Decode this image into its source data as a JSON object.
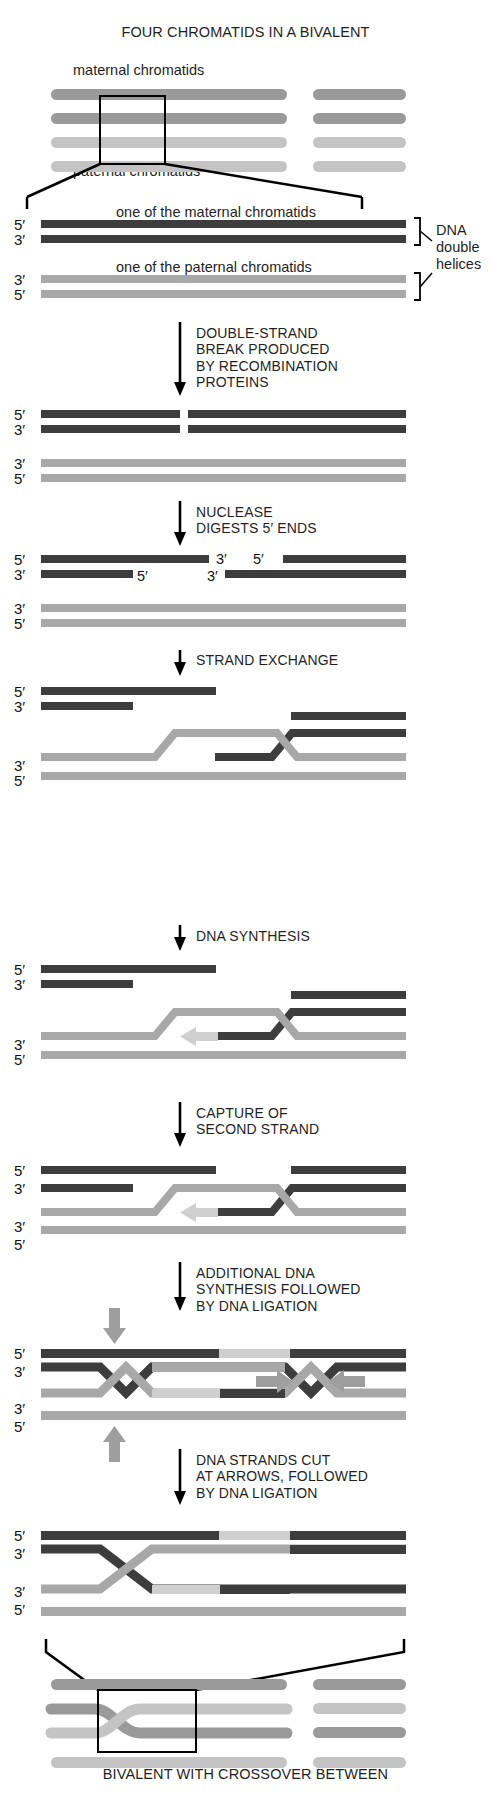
{
  "figure": {
    "title_top": "FOUR CHROMATIDS IN A BIVALENT",
    "title_bottom": "BIVALENT WITH CROSSOVER BETWEEN",
    "label_maternal_chromatids": "maternal chromatids",
    "label_paternal_chromatids": "paternal chromatids",
    "label_one_maternal": "one of the maternal chromatids",
    "label_one_paternal": "one of the paternal chromatids",
    "label_dna_double_helices": "DNA\ndouble\nhelices",
    "label_dna_line1": "DNA",
    "label_dna_line2": "double",
    "label_dna_line3": "helices"
  },
  "colors": {
    "maternal_dark": "#3d3d3d",
    "maternal_mid": "#575757",
    "paternal_light": "#a8a8a8",
    "paternal_pale": "#bdbdbd",
    "new_synthesis": "#cfcfcf",
    "chromatid_dark": "#9a9a9a",
    "chromatid_light": "#c4c4c4",
    "arrow_black": "#000000",
    "arrow_gray": "#9e9e9e",
    "outline": "#000000",
    "background": "#ffffff",
    "text": "#1f1f1f"
  },
  "steps": [
    {
      "id": "double-strand-break",
      "text": "DOUBLE-STRAND\nBREAK PRODUCED\nBY RECOMBINATION\nPROTEINS"
    },
    {
      "id": "nuclease-digestion",
      "text": "NUCLEASE\nDIGESTS 5′ ENDS"
    },
    {
      "id": "strand-exchange",
      "text": "STRAND EXCHANGE"
    },
    {
      "id": "dna-synthesis",
      "text": "DNA SYNTHESIS"
    },
    {
      "id": "capture-second-strand",
      "text": "CAPTURE OF\nSECOND STRAND"
    },
    {
      "id": "additional-synthesis-ligation",
      "text": "ADDITIONAL DNA\nSYNTHESIS FOLLOWED\nBY DNA LIGATION"
    },
    {
      "id": "strands-cut-ligation",
      "text": "DNA STRANDS CUT\nAT ARROWS, FOLLOWED\nBY DNA LIGATION"
    }
  ],
  "prime_labels": {
    "five": "5′",
    "three": "3′"
  },
  "panels": [
    {
      "id": "bivalent-top",
      "name": "four chromatids in a bivalent",
      "chromatid_count": 4,
      "prime_marks": []
    },
    {
      "id": "two-duplexes",
      "name": "one maternal and one paternal DNA duplex",
      "prime_marks": [
        "5′",
        "3′",
        "3′",
        "5′"
      ]
    },
    {
      "id": "after-break",
      "name": "maternal duplex with double-strand break",
      "prime_marks": [
        "5′",
        "3′",
        "3′",
        "5′"
      ]
    },
    {
      "id": "after-resection",
      "name": "resected 3 prime single-strand overhangs",
      "prime_marks": [
        "5′",
        "3′",
        "3′",
        "5′"
      ],
      "inner_marks": [
        "3′",
        "5′",
        "5′",
        "3′"
      ]
    },
    {
      "id": "after-strand-exchange",
      "name": "strand invasion of paternal duplex",
      "prime_marks": [
        "5′",
        "3′",
        "3′",
        "5′"
      ]
    },
    {
      "id": "after-dna-synthesis",
      "name": "dna synthesis extends invading strand",
      "prime_marks": [
        "5′",
        "3′",
        "3′",
        "5′"
      ]
    },
    {
      "id": "after-second-strand-capture",
      "name": "second end capture forming joint molecule",
      "prime_marks": [
        "5′",
        "3′",
        "3′",
        "5′"
      ]
    },
    {
      "id": "double-holliday-junction",
      "name": "double holliday junction with cut site arrows",
      "prime_marks": [
        "5′",
        "3′",
        "3′",
        "5′"
      ],
      "cut_arrows": 4
    },
    {
      "id": "resolved-crossover",
      "name": "resolved crossover product",
      "prime_marks": [
        "5′",
        "3′",
        "3′",
        "5′"
      ]
    },
    {
      "id": "bivalent-bottom",
      "name": "bivalent with crossover between chromatids",
      "chromatid_count": 4
    }
  ]
}
